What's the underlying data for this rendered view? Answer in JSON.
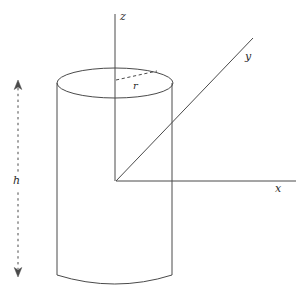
{
  "figure": {
    "background_color": "#ffffff",
    "stroke_color": "#4a4a4a",
    "width": 304,
    "height": 296
  },
  "axes": {
    "z": {
      "label": "z",
      "icon": "axis-line-vertical",
      "from": [
        115,
        14
      ],
      "to": [
        115,
        181
      ]
    },
    "x": {
      "label": "x",
      "icon": "axis-line-horizontal",
      "from": [
        116,
        181
      ],
      "to": [
        296,
        181
      ]
    },
    "y": {
      "label": "y",
      "icon": "axis-line-diagonal",
      "from": [
        116,
        181
      ],
      "to": [
        253,
        38
      ]
    },
    "origin": [
      116,
      181
    ]
  },
  "solid": {
    "name": "cylinder",
    "top_ellipse": {
      "cx": 115,
      "cy": 83,
      "rx": 58,
      "ry": 15
    },
    "left_side_x": 57,
    "right_side_x": 172,
    "bottom_y": 285
  },
  "dimensions": {
    "radius": {
      "label": "r",
      "icon": "dashed-radius-line",
      "from": [
        116,
        80
      ],
      "to": [
        157,
        72
      ]
    },
    "height": {
      "label": "h",
      "icon": "dashed-double-arrow-vertical",
      "x": 18,
      "from_y": 80,
      "to_y": 277
    }
  }
}
